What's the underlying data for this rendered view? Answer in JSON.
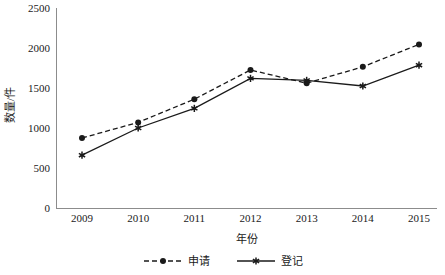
{
  "chart_data": {
    "type": "line",
    "title": "",
    "xlabel": "年份",
    "ylabel": "数量/件",
    "x": [
      "2009",
      "2010",
      "2011",
      "2012",
      "2013",
      "2014",
      "2015"
    ],
    "categories": [
      "2009",
      "2010",
      "2011",
      "2012",
      "2013",
      "2014",
      "2015"
    ],
    "series": [
      {
        "name": "申请",
        "values": [
          875,
          1070,
          1360,
          1725,
          1560,
          1765,
          2045
        ],
        "line_style": "dashed",
        "marker": "circle",
        "color": "#1a1a1a"
      },
      {
        "name": "登记",
        "values": [
          660,
          1000,
          1245,
          1620,
          1595,
          1525,
          1785
        ],
        "line_style": "solid",
        "marker": "star",
        "color": "#1a1a1a"
      }
    ],
    "ylim": [
      0,
      2500
    ],
    "yticks": [
      0,
      500,
      1000,
      1500,
      2000,
      2500
    ],
    "ytick_labels": [
      "0",
      "500",
      "1000",
      "1500",
      "2000",
      "2500"
    ],
    "grid": false,
    "legend_position": "bottom",
    "axis_color": "#8c8c8c",
    "background": "#ffffff"
  },
  "legend": {
    "items": [
      {
        "label": "申请"
      },
      {
        "label": "登记"
      }
    ]
  },
  "axes": {
    "y_title": "数量/件",
    "x_title": "年份"
  }
}
